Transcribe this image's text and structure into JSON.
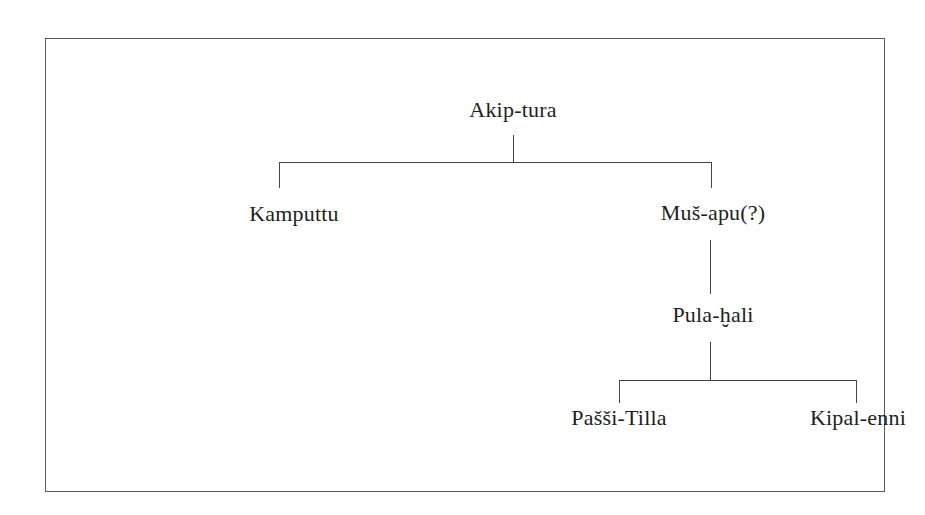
{
  "figure": {
    "kind": "genealogical-family-tree",
    "border_color": "#5a5a5a",
    "line_color": "#44444a",
    "text_color": "#1e1e20",
    "background_color": "#ffffff"
  },
  "tree": {
    "generations": [
      {
        "level": 1,
        "nodes": [
          {
            "id": "akip-tura",
            "label": "Akip-tura"
          }
        ]
      },
      {
        "level": 2,
        "nodes": [
          {
            "id": "kamputtu",
            "label": "Kamputtu"
          },
          {
            "id": "mus-apu",
            "label": "Muš-apu(?)"
          }
        ]
      },
      {
        "level": 3,
        "nodes": [
          {
            "id": "pula-hali",
            "label": "Pula-ḫali"
          }
        ]
      },
      {
        "level": 4,
        "nodes": [
          {
            "id": "passi-tilla",
            "label": "Pašši-Tilla"
          },
          {
            "id": "kipal-enni",
            "label": "Kipal-enni"
          }
        ]
      }
    ],
    "edges": [
      {
        "from": "akip-tura",
        "to": "kamputtu"
      },
      {
        "from": "akip-tura",
        "to": "mus-apu"
      },
      {
        "from": "mus-apu",
        "to": "pula-hali"
      },
      {
        "from": "pula-hali",
        "to": "passi-tilla"
      },
      {
        "from": "pula-hali",
        "to": "kipal-enni"
      }
    ]
  }
}
